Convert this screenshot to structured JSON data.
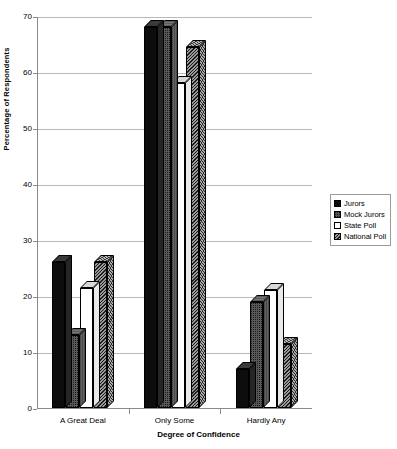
{
  "chart_data": {
    "type": "bar",
    "title": "",
    "xlabel": "Degree of Confidence",
    "ylabel": "Percentage of Respondents",
    "categories": [
      "A Great Deal",
      "Only Some",
      "Hardly Any"
    ],
    "series": [
      {
        "name": "Jurors",
        "values": [
          26,
          68,
          7
        ]
      },
      {
        "name": "Mock Jurors",
        "values": [
          13,
          68,
          19
        ]
      },
      {
        "name": "State Poll",
        "values": [
          21.5,
          58,
          21
        ]
      },
      {
        "name": "National Poll",
        "values": [
          26,
          64.5,
          11.5
        ]
      }
    ],
    "ylim": [
      0,
      70
    ],
    "yticks": [
      0,
      10,
      20,
      30,
      40,
      50,
      60,
      70
    ],
    "ytick_labels": [
      "0",
      "10",
      "20",
      "30",
      "40",
      "50",
      "60",
      "70"
    ],
    "grid": true,
    "legend_position": "right",
    "colors": {
      "jurors": "#0d0d0d",
      "mock_jurors": "#595959",
      "state_poll": "#ffffff",
      "national_poll": "#6e6e6e",
      "gridline": "#b9b9b9",
      "axis": "#8a8a8a",
      "background": "#ffffff"
    }
  },
  "legend": {
    "items": [
      {
        "label": "Jurors"
      },
      {
        "label": "Mock Jurors"
      },
      {
        "label": "State Poll"
      },
      {
        "label": "National Poll"
      }
    ]
  }
}
